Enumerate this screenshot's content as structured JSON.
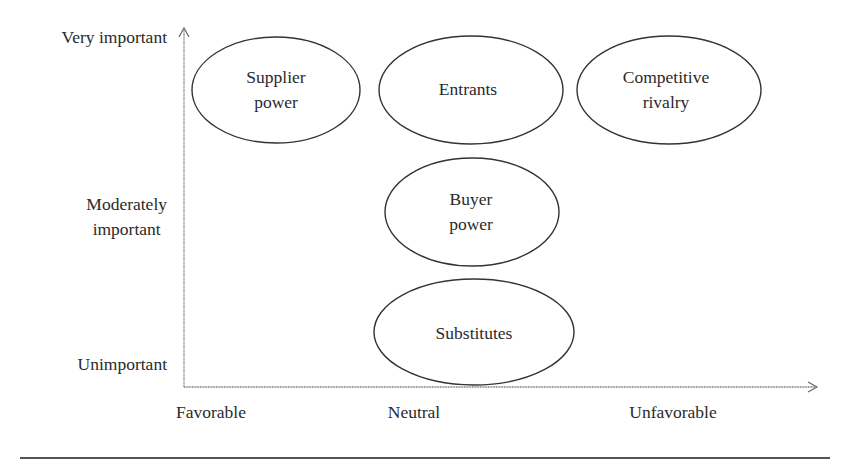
{
  "y_axis": {
    "labels": [
      "Very important",
      "Moderately\nimportant",
      "Unimportant"
    ]
  },
  "x_axis": {
    "labels": [
      "Favorable",
      "Neutral",
      "Unfavorable"
    ]
  },
  "nodes": [
    {
      "label": "Supplier\npower",
      "x": "Favorable",
      "y": "Very important"
    },
    {
      "label": "Entrants",
      "x": "Neutral",
      "y": "Very important"
    },
    {
      "label": "Competitive\nrivalry",
      "x": "Unfavorable",
      "y": "Very important"
    },
    {
      "label": "Buyer\npower",
      "x": "Neutral",
      "y": "Moderately important"
    },
    {
      "label": "Substitutes",
      "x": "Neutral",
      "y": "Unimportant"
    }
  ],
  "colors": {
    "line": "#333333",
    "axis": "#777777",
    "rule": "#555555"
  }
}
